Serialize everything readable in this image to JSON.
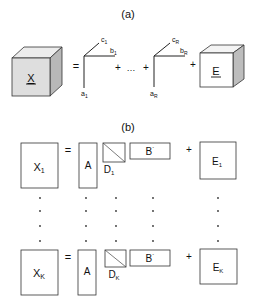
{
  "panel_a": {
    "title": "(a)",
    "tensor_label": "X",
    "equals": "=",
    "terms": [
      {
        "a": "a",
        "a_sub": "1",
        "b": "b",
        "b_sub": "1",
        "c": "c",
        "c_sub": "1"
      },
      {
        "a": "a",
        "a_sub": "R",
        "b": "b",
        "b_sub": "R",
        "c": "c",
        "c_sub": "R"
      }
    ],
    "plus": "+",
    "ellipsis": "…",
    "error_label": "E",
    "colors": {
      "cube_front_x": "#dedede",
      "cube_side_x": "#b8b8b8",
      "cube_top_x": "#ececec",
      "cube_front_e": "#ffffff",
      "cube_side_e": "#bdbdbd",
      "cube_top_e": "#f4f4f4",
      "stroke": "#333333"
    }
  },
  "panel_b": {
    "title": "(b)",
    "rows": [
      {
        "x": "X",
        "x_sub": "1",
        "a": "A",
        "d": "D",
        "d_sub": "1",
        "b": "B",
        "b_prime": "´",
        "e": "E",
        "e_sub": "1"
      },
      {
        "x": "X",
        "x_sub": "K",
        "a": "A",
        "d": "D",
        "d_sub": "K",
        "b": "B",
        "b_prime": "´",
        "e": "E",
        "e_sub": "K"
      }
    ],
    "equals": "=",
    "plus": "+",
    "dot": "·"
  }
}
